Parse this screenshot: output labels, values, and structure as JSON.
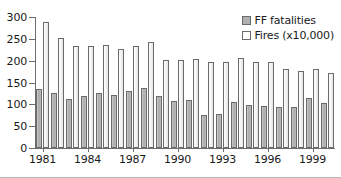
{
  "chart_data": {
    "type": "bar",
    "title": "",
    "subtitle": "",
    "xlabel": "",
    "ylabel": "",
    "ylim": [
      0,
      300
    ],
    "yticks": [
      0,
      50,
      100,
      150,
      200,
      250,
      300
    ],
    "xticks": [
      1981,
      1984,
      1987,
      1990,
      1993,
      1996,
      1999
    ],
    "grid": false,
    "legend_position": "top-right",
    "categories": [
      1981,
      1982,
      1983,
      1984,
      1985,
      1986,
      1987,
      1988,
      1989,
      1990,
      1991,
      1992,
      1993,
      1994,
      1995,
      1996,
      1997,
      1998,
      1999,
      2000
    ],
    "series": [
      {
        "name": "FF fatalities",
        "color": "#b0b0b0",
        "values": [
          135,
          125,
          113,
          119,
          126,
          122,
          131,
          138,
          119,
          108,
          110,
          75,
          77,
          105,
          98,
          96,
          95,
          93,
          114,
          103
        ]
      },
      {
        "name": "Fires (x10,000)",
        "color": "#ffffff",
        "values": [
          288,
          252,
          233,
          233,
          236,
          227,
          233,
          243,
          202,
          202,
          204,
          196,
          196,
          205,
          197,
          197,
          180,
          177,
          182,
          171
        ]
      }
    ]
  },
  "legend": {
    "items": [
      {
        "label": "FF fatalities"
      },
      {
        "label": "Fires (x10,000)"
      }
    ]
  },
  "colors": {
    "bar_fatalities": "#b0b0b0",
    "bar_fires": "#ffffff",
    "bar_outline": "#6b6b6b",
    "axis": "#6e6e6e",
    "text": "#1a1a1a",
    "background": "#ffffff"
  }
}
